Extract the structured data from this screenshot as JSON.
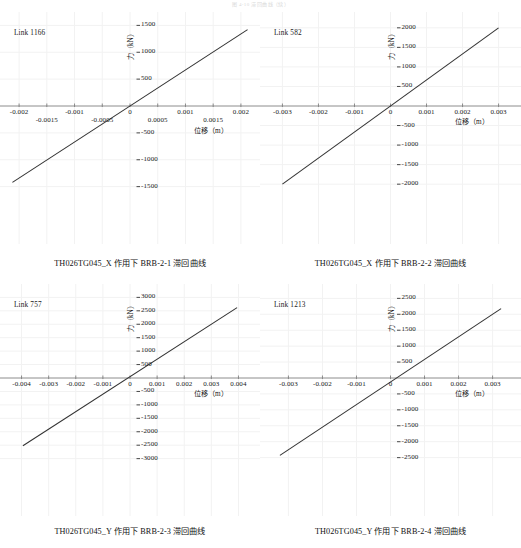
{
  "page": {
    "header_text": "图 4-10  滞回曲线（续）"
  },
  "axis_titles": {
    "y": "力（kN）",
    "x": "位移（m）"
  },
  "style": {
    "line_color": "#333333",
    "grid_color": "#f2f2f2",
    "axis_color": "#808080",
    "text_color": "#1a1a1a"
  },
  "charts": [
    {
      "link_label": "Link 1166",
      "caption": "TH026TG045_X 作用下 BRB-2-1 滞回曲线",
      "chart_data": {
        "type": "line",
        "title": "TH026TG045_X 作用下 BRB-2-1 滞回曲线",
        "series_name": "Link 1166",
        "xlabel": "位移（m）",
        "ylabel": "力（kN）",
        "xlim": [
          -0.0022,
          0.0022
        ],
        "ylim": [
          -1600,
          1600
        ],
        "xticks": [
          -0.002,
          -0.0015,
          -0.001,
          -0.0005,
          0,
          0.0005,
          0.001,
          0.0015,
          0.002
        ],
        "xticklabels": [
          "-0.002",
          "-0.0015",
          "-0.001",
          "-0.0005",
          "0",
          "0.0005",
          "0.001",
          "0.0015",
          "0.002"
        ],
        "xtick_stagger": true,
        "yticks": [
          -1500,
          -1000,
          -500,
          500,
          1000,
          1500
        ],
        "yticklabels": [
          "-1500",
          "-1000",
          "-500",
          "500",
          "1000",
          "1500"
        ],
        "grid": true,
        "legend": "none",
        "x": [
          -0.00212,
          0.00212
        ],
        "y": [
          -1420,
          1420
        ],
        "slope_kN_per_m": 669811
      }
    },
    {
      "link_label": "Link 582",
      "caption": "TH026TG045_X 作用下 BRB-2-2 滞回曲线",
      "chart_data": {
        "type": "line",
        "title": "TH026TG045_X 作用下 BRB-2-2 滞回曲线",
        "series_name": "Link 582",
        "xlabel": "位移（m）",
        "ylabel": "力（kN）",
        "xlim": [
          -0.0034,
          0.0034
        ],
        "ylim": [
          -2200,
          2200
        ],
        "xticks": [
          -0.003,
          -0.002,
          -0.001,
          0,
          0.001,
          0.002,
          0.003
        ],
        "xticklabels": [
          "-0.003",
          "-0.002",
          "-0.001",
          "0",
          "0.001",
          "0.002",
          "0.003"
        ],
        "xtick_stagger": false,
        "yticks": [
          -2000,
          -1500,
          -1000,
          -500,
          500,
          1000,
          1500,
          2000
        ],
        "yticklabels": [
          "-2000",
          "-1500",
          "-1000",
          "-500",
          "500",
          "1000",
          "1500",
          "2000"
        ],
        "grid": true,
        "legend": "none",
        "x": [
          -0.003,
          0.003
        ],
        "y": [
          -2000,
          2000
        ],
        "slope_kN_per_m": 666667
      }
    },
    {
      "link_label": "Link 757",
      "caption": "TH026TG045_Y 作用下 BRB-2-3 滞回曲线",
      "chart_data": {
        "type": "line",
        "title": "TH026TG045_Y 作用下 BRB-2-3 滞回曲线",
        "series_name": "Link 757",
        "xlabel": "位移（m）",
        "ylabel": "力（kN）",
        "xlim": [
          -0.0045,
          0.0045
        ],
        "ylim": [
          -3200,
          3200
        ],
        "xticks": [
          -0.004,
          -0.003,
          -0.002,
          -0.001,
          0,
          0.001,
          0.002,
          0.003,
          0.004
        ],
        "xticklabels": [
          "-0.004",
          "-0.003",
          "-0.002",
          "-0.001",
          "0",
          "0.001",
          "0.002",
          "0.003",
          "0.004"
        ],
        "xtick_stagger": false,
        "yticks": [
          -3000,
          -2500,
          -2000,
          -1500,
          -1000,
          -500,
          500,
          1000,
          1500,
          2000,
          2500,
          3000
        ],
        "yticklabels": [
          "-3000",
          "-2500",
          "-2000",
          "-1500",
          "-1000",
          "-500",
          "500",
          "1000",
          "1500",
          "2000",
          "2500",
          "3000"
        ],
        "grid": true,
        "legend": "none",
        "x": [
          -0.00395,
          0.00395
        ],
        "y": [
          -2520,
          2620
        ],
        "slope_kN_per_m": 650000
      }
    },
    {
      "link_label": "Link 1213",
      "caption": "TH026TG045_Y 作用下 BRB-2-4 滞回曲线",
      "chart_data": {
        "type": "line",
        "title": "TH026TG045_Y 作用下 BRB-2-4 滞回曲线",
        "series_name": "Link 1213",
        "xlabel": "位移（m）",
        "ylabel": "力（kN）",
        "xlim": [
          -0.0036,
          0.0036
        ],
        "ylim": [
          -2700,
          2700
        ],
        "xticks": [
          -0.003,
          -0.002,
          -0.001,
          0,
          0.001,
          0.002,
          0.003
        ],
        "xticklabels": [
          "-0.003",
          "-0.002",
          "-0.001",
          "0",
          "0.001",
          "0.002",
          "0.003"
        ],
        "xtick_stagger": false,
        "yticks": [
          -2500,
          -2000,
          -1500,
          -1000,
          -500,
          500,
          1000,
          1500,
          2000,
          2500
        ],
        "yticklabels": [
          "-2500",
          "-2000",
          "-1500",
          "-1000",
          "-500",
          "500",
          "1000",
          "1500",
          "2000",
          "2500"
        ],
        "grid": true,
        "legend": "none",
        "x": [
          -0.00325,
          0.00325
        ],
        "y": [
          -2430,
          2180
        ],
        "slope_kN_per_m": 710000
      }
    }
  ]
}
